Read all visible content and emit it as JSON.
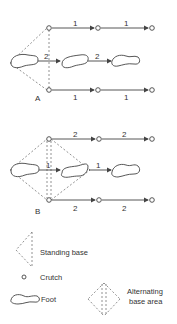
{
  "diagram_a": {
    "label": "A",
    "crutch_path_label": "1",
    "foot_path_label": "2",
    "top_labels": [
      "1",
      "1"
    ],
    "middle_labels": [
      "2",
      "2"
    ],
    "bottom_labels": [
      "1",
      "1"
    ]
  },
  "diagram_b": {
    "label": "B",
    "top_labels": [
      "2",
      "2"
    ],
    "middle_labels": [
      "1",
      "1"
    ],
    "bottom_labels": [
      "2",
      "2"
    ]
  },
  "legend": {
    "standing_base": "Standing base",
    "crutch": "Crutch",
    "foot": "Foot",
    "alternating_line1": "Alternating",
    "alternating_line2": "base area"
  },
  "colors": {
    "line": "#444444",
    "dash": "#777777",
    "text": "#333333"
  }
}
